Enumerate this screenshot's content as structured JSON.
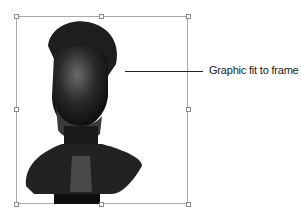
{
  "figure": {
    "callout_label": "Graphic fit to frame",
    "frame_color": "#a8a8a8",
    "image_subject": "bronze bust portrait",
    "handles": [
      "top-left",
      "top-center",
      "top-right",
      "middle-left",
      "middle-right",
      "bottom-left",
      "bottom-center",
      "bottom-right"
    ]
  }
}
